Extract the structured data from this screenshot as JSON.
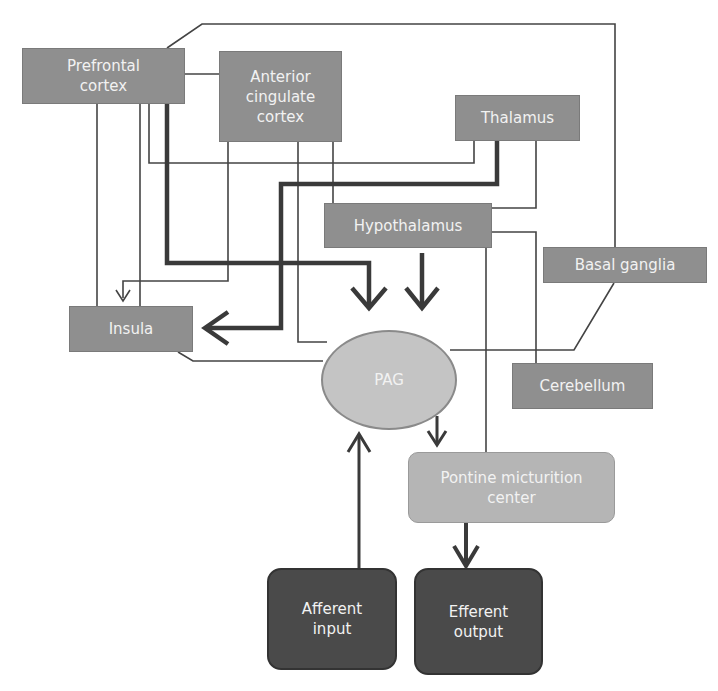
{
  "diagram": {
    "nodes": {
      "prefrontal": {
        "label": "Prefrontal cortex"
      },
      "acc": {
        "label": "Anterior cingulate cortex"
      },
      "thalamus": {
        "label": "Thalamus"
      },
      "hypothalamus": {
        "label": "Hypothalamus"
      },
      "basal_ganglia": {
        "label": "Basal ganglia"
      },
      "insula": {
        "label": "Insula"
      },
      "pag": {
        "label": "PAG"
      },
      "cerebellum": {
        "label": "Cerebellum"
      },
      "pmc": {
        "label": "Pontine micturition center"
      },
      "afferent": {
        "label": "Afferent input"
      },
      "efferent": {
        "label": "Efferent output"
      }
    },
    "colors": {
      "box_mid": "#8f8f8f",
      "box_light": "#b5b5b5",
      "box_dark": "#4a4a4a",
      "ellipse": "#c4c4c4",
      "wire": "#444444"
    },
    "edges": [
      {
        "from": "Prefrontal cortex",
        "to": "PAG",
        "style": "thick-arrow"
      },
      {
        "from": "Thalamus",
        "to": "Insula",
        "style": "thick-arrow"
      },
      {
        "from": "Hypothalamus",
        "to": "PAG",
        "style": "thick-arrow"
      },
      {
        "from": "Anterior cingulate cortex",
        "to": "Insula",
        "style": "thin-arrow"
      },
      {
        "from": "PAG",
        "to": "Pontine micturition center",
        "style": "arrow"
      },
      {
        "from": "Afferent input",
        "to": "PAG",
        "style": "arrow"
      },
      {
        "from": "Pontine micturition center",
        "to": "Efferent output",
        "style": "thick-arrow"
      },
      {
        "from": "Prefrontal cortex",
        "to": "Anterior cingulate cortex",
        "style": "line"
      },
      {
        "from": "Prefrontal cortex",
        "to": "Basal ganglia",
        "style": "line"
      },
      {
        "from": "Prefrontal cortex",
        "to": "Thalamus",
        "style": "line"
      },
      {
        "from": "Prefrontal cortex",
        "to": "Insula",
        "style": "line"
      },
      {
        "from": "Thalamus",
        "to": "Hypothalamus",
        "style": "line"
      },
      {
        "from": "Hypothalamus",
        "to": "Cerebellum",
        "style": "line"
      },
      {
        "from": "Hypothalamus",
        "to": "Pontine micturition center",
        "style": "line"
      },
      {
        "from": "Insula",
        "to": "PAG",
        "style": "line"
      },
      {
        "from": "Basal ganglia",
        "to": "PAG",
        "style": "line"
      },
      {
        "from": "Anterior cingulate cortex",
        "to": "PAG",
        "style": "line"
      }
    ]
  }
}
